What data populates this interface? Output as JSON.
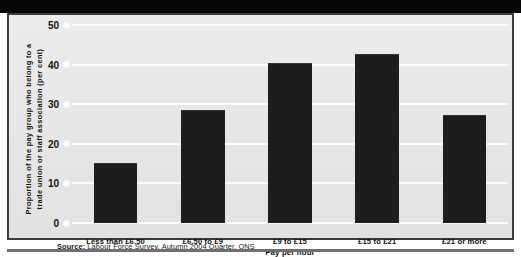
{
  "figure": {
    "source_label": "Source:",
    "source_text": " Labour Force Survey, Autumn 2004 Quarter, ONS"
  },
  "chart_data": {
    "type": "bar",
    "title": "",
    "subtitle": "",
    "categories": [
      "Less than £6.50",
      "£6.50 to £9",
      "£9 to £15",
      "£15 to £21",
      "£21 or more"
    ],
    "values": [
      15.1,
      28.6,
      40.5,
      42.7,
      27.3
    ],
    "xlabel": "Pay per hour",
    "ylabel": "Proportion of the pay group who belong to a trade union or staff association (per cent)",
    "ylabel_line1": "Proportion of the pay group who belong to a",
    "ylabel_line2": "trade union or staff association (per cent)",
    "ylim": [
      0,
      50
    ],
    "yticks": [
      0,
      10,
      20,
      30,
      40,
      50
    ],
    "ytick_labels": [
      "0",
      "10",
      "20",
      "30",
      "40",
      "50"
    ],
    "grid": true,
    "grid_color": "#fbfbfb",
    "legend": null,
    "bar_color": "#1d1d1d",
    "background_color": "#e9e9e9"
  }
}
